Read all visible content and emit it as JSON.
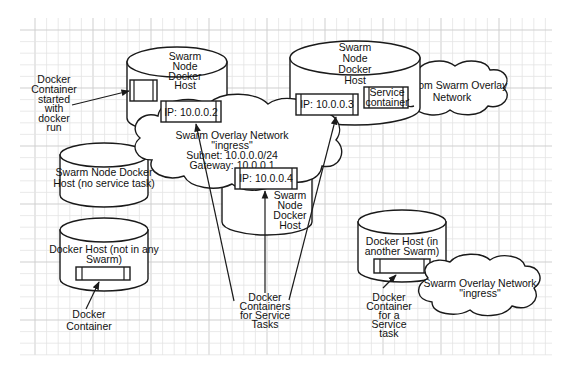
{
  "diagram": {
    "hosts": {
      "top_left": {
        "label_lines": [
          "Swarm",
          "Node",
          "Docker",
          "Host"
        ]
      },
      "top_right": {
        "label_lines": [
          "Swarm",
          "Node",
          "Docker",
          "Host"
        ]
      },
      "center": {
        "label_lines": [
          "Swarm",
          "Node",
          "Docker",
          "Host"
        ]
      },
      "left_middle": {
        "label_lines": [
          "Swarm Node Docker",
          "Host (no service task)"
        ]
      },
      "left_bottom": {
        "label_lines": [
          "Docker Host (not in any",
          "Swarm)"
        ]
      },
      "right_bottom": {
        "label_lines": [
          "Docker Host (in",
          "another Swarm)"
        ]
      }
    },
    "containers": {
      "ip_2": "IP: 10.0.0.2",
      "ip_3": "IP: 10.0.0.3",
      "ip_4": "IP: 10.0.0.4",
      "service_container": [
        "Service",
        "container"
      ]
    },
    "networks": {
      "ingress_main": [
        "Swarm Overlay Network",
        "\"ingress\"",
        "Subnet: 10.0.0.0/24",
        "Gateway: 10.0.0.1"
      ],
      "custom_overlay": [
        "Custom Swarm Overlay",
        "Network"
      ],
      "ingress_other": [
        "Swarm Overlay Network",
        "\"ingress\""
      ]
    },
    "callouts": {
      "docker_run": [
        "Docker",
        "Container",
        "started",
        "with",
        "docker",
        "run"
      ],
      "docker_container": [
        "Docker",
        "Container"
      ],
      "service_tasks": [
        "Docker",
        "Containers",
        "for Service",
        "Tasks"
      ],
      "service_task_other": [
        "Docker",
        "Container",
        "for a",
        "Service",
        "task"
      ]
    }
  }
}
